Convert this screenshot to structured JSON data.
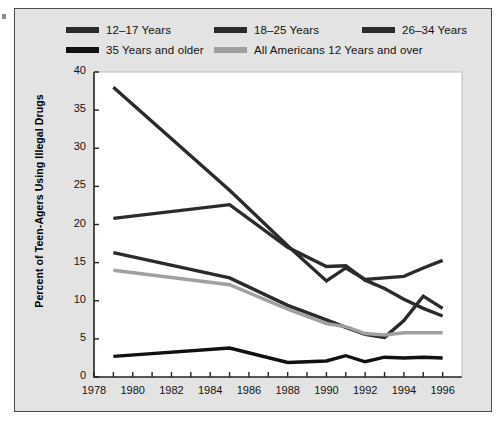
{
  "chart_data": {
    "type": "line",
    "title": "",
    "xlabel": "",
    "ylabel": "Percent of Teen-Agers Using Illegal Drugs",
    "xlim": [
      1978,
      1997
    ],
    "ylim": [
      0,
      40
    ],
    "yticks": [
      0,
      5,
      10,
      15,
      20,
      25,
      30,
      35,
      40
    ],
    "xticks": [
      1978,
      1979,
      1980,
      1981,
      1982,
      1983,
      1984,
      1985,
      1986,
      1987,
      1988,
      1989,
      1990,
      1991,
      1992,
      1993,
      1994,
      1995,
      1996
    ],
    "xtick_labels": [
      "1978",
      "1980",
      "1982",
      "1984",
      "1986",
      "1988",
      "1990",
      "1992",
      "1994",
      "1996"
    ],
    "xtick_label_years": [
      1978,
      1980,
      1982,
      1984,
      1986,
      1988,
      1990,
      1992,
      1994,
      1996
    ],
    "grid": false,
    "legend_position": "top",
    "x": [
      1979,
      1985,
      1988,
      1990,
      1991,
      1992,
      1993,
      1994,
      1995,
      1996
    ],
    "series": [
      {
        "name": "12–17 Years",
        "color": "#2b2b2b",
        "values": [
          38.0,
          24.5,
          17.2,
          12.6,
          14.3,
          12.8,
          13.0,
          13.2,
          14.3,
          15.3
        ]
      },
      {
        "name": "18–25 Years",
        "color": "#2b2b2b",
        "values": [
          20.8,
          22.6,
          17.0,
          14.5,
          14.6,
          12.7,
          11.6,
          10.2,
          9.0,
          8.0
        ]
      },
      {
        "name": "26–34 Years",
        "color": "#2b2b2b",
        "values": [
          16.3,
          13.0,
          9.4,
          7.5,
          6.5,
          5.6,
          5.2,
          7.4,
          10.6,
          9.0
        ]
      },
      {
        "name": "35 Years and older",
        "color": "#111111",
        "values": [
          2.7,
          3.8,
          1.9,
          2.1,
          2.8,
          2.0,
          2.6,
          2.5,
          2.6,
          2.5
        ]
      },
      {
        "name": "All Americans 12 Years and over",
        "color": "#a0a0a0",
        "values": [
          14.0,
          12.1,
          8.9,
          7.0,
          6.6,
          5.7,
          5.5,
          5.8,
          5.8,
          5.8
        ]
      }
    ]
  },
  "legend": {
    "rows": [
      [
        {
          "label": "12–17 Years",
          "color": "#2b2b2b"
        },
        {
          "label": "18–25 Years",
          "color": "#2b2b2b"
        },
        {
          "label": "26–34 Years",
          "color": "#2b2b2b"
        }
      ],
      [
        {
          "label": "35 Years and older",
          "color": "#111111"
        },
        {
          "label": "All Americans 12 Years and over",
          "color": "#a0a0a0"
        }
      ]
    ]
  },
  "axis": {
    "y_title": "Percent of Teen-Agers Using Illegal Drugs",
    "y_labels": [
      "40",
      "35",
      "30",
      "25",
      "20",
      "15",
      "10",
      "5",
      "0"
    ],
    "x_labels": [
      "1978",
      "1980",
      "1982",
      "1984",
      "1986",
      "1988",
      "1990",
      "1992",
      "1994",
      "1996"
    ]
  },
  "colors": {
    "panel_background": "#e3e3e3",
    "plot_background": "#ffffff",
    "axis": "#222222",
    "series_dark": "#2b2b2b",
    "series_black": "#111111",
    "series_gray": "#a0a0a0"
  }
}
